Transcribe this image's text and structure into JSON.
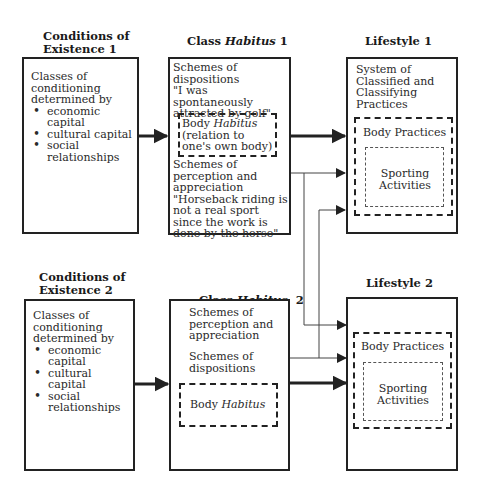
{
  "columns": {
    "conditions1": {
      "heading_line1": "Conditions of",
      "heading_line2": "Existence 1",
      "intro": "Classes of conditioning determined by",
      "bullets": [
        "economic capital",
        "cultural capital",
        "social relationships"
      ]
    },
    "habitus1": {
      "heading_prefix": "Class ",
      "heading_italic": "Habitus",
      "heading_suffix": " 1",
      "dispositions": "Schemes of dispositions",
      "dispositions_quote": "\"I was spontaneously attracted by golf\"",
      "body_habitus_prefix": "Body ",
      "body_habitus_italic": "Habitus",
      "body_habitus_note": "(relation to one's own body)",
      "perception": "Schemes of perception and appreciation",
      "perception_quote": "\"Horseback riding is not a real sport since the work is done by the horse\""
    },
    "lifestyle1": {
      "heading": "Lifestyle 1",
      "system": "System of Classified and Classifying Practices",
      "body_practices": "Body Practices",
      "sporting": "Sporting Activities"
    },
    "conditions2": {
      "heading_line1": "Conditions of",
      "heading_line2": "Existence 2",
      "intro": "Classes of conditioning determined by",
      "bullets": [
        "economic capital",
        "cultural capital",
        "social relationships"
      ]
    },
    "habitus2": {
      "heading_prefix": "Class ",
      "heading_italic": "Habitus",
      "heading_suffix": "  2",
      "perception": "Schemes of perception and appreciation",
      "dispositions": "Schemes of dispositions",
      "body_habitus_prefix": "Body ",
      "body_habitus_italic": "Habitus"
    },
    "lifestyle2": {
      "heading": "Lifestyle 2",
      "body_practices": "Body Practices",
      "sporting": "Sporting Activities"
    }
  },
  "colors": {
    "line": "#222222",
    "thin_line": "#555555",
    "background": "#ffffff"
  }
}
